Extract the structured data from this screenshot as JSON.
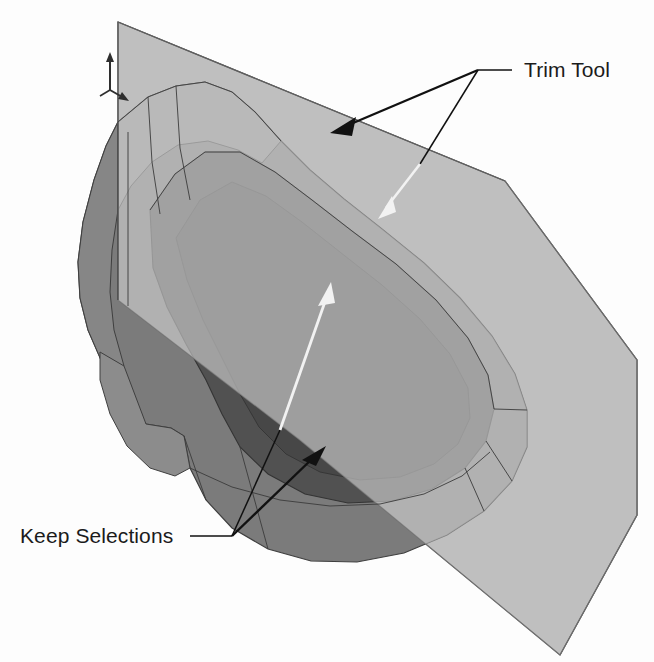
{
  "figure": {
    "kind": "cad-3d-viewport-illustration",
    "background_color": "#fdfdfd",
    "description_text": "",
    "annotations": [
      {
        "id": "trim-tool",
        "label": "Trim Tool",
        "label_color": "#1b1b1b",
        "leader_color": "#111111",
        "arrow_colors": [
          "#111111",
          "#f2f2f2"
        ],
        "arrow_count": 2
      },
      {
        "id": "keep-selections",
        "label": "Keep Selections",
        "label_color": "#1b1b1b",
        "leader_color": "#111111",
        "arrow_colors": [
          "#111111",
          "#f2f2f2"
        ],
        "arrow_count": 2
      }
    ]
  },
  "labels": {
    "trim_tool": "Trim Tool",
    "keep_selections": "Keep Selections"
  },
  "colors": {
    "background": "#fdfdfd",
    "trim_plane": "#b3b3b3",
    "trim_plane_behind": "#a6a6a6",
    "solid_top_light": "#8e8e8e",
    "solid_mid": "#7b7b7b",
    "solid_band": "#6e6e6e",
    "solid_dark": "#4c4c4c",
    "solid_darkest": "#434343",
    "edge_line": "#3a3a3a",
    "text": "#1b1b1b",
    "white_arrow": "#f2f2f2"
  },
  "axis_triad": {
    "name": "coordinate-triad",
    "z_label": "",
    "x_label": "",
    "y_label": ""
  }
}
